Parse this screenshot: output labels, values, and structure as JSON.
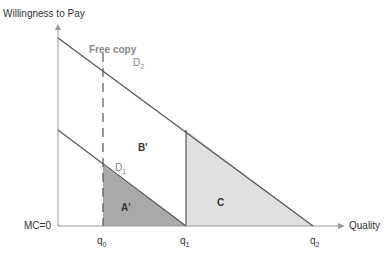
{
  "axes": {
    "y_label": "Willingness to Pay",
    "x_label": "Quality",
    "origin_label": "MC=0"
  },
  "annotations": {
    "free_copy": "Free copy",
    "d2": {
      "base": "D",
      "sub": "2"
    },
    "d1": {
      "base": "D",
      "sub": "1"
    },
    "area_a": "A'",
    "area_b": "B'",
    "area_c": "C"
  },
  "ticks": {
    "q0": {
      "base": "q",
      "sub": "0"
    },
    "q1": {
      "base": "q",
      "sub": "1"
    },
    "q2": {
      "base": "q",
      "sub": "2"
    }
  },
  "colors": {
    "area_a": "#a9a9a9",
    "area_c": "#e0e0e0",
    "lines": "#555555",
    "axis": "#999999"
  }
}
